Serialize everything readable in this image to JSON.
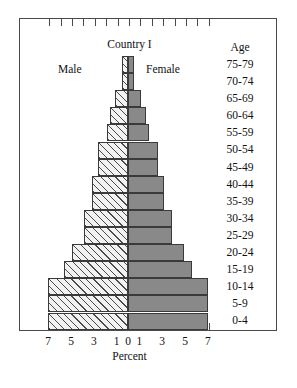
{
  "chart_data": {
    "type": "bar",
    "subtype": "population-pyramid",
    "title": "Country I",
    "xlabel": "Percent",
    "ylabel": "Age",
    "grid": false,
    "legend_position": "in-plot",
    "xlim": [
      -7,
      7
    ],
    "xticks": [
      -7,
      -6,
      -5,
      -4,
      -3,
      -2,
      -1,
      0,
      1,
      2,
      3,
      4,
      5,
      6,
      7
    ],
    "xtick_labels": [
      "7",
      "",
      "5",
      "",
      "3",
      "",
      "1",
      "0",
      "1",
      "",
      "3",
      "",
      "5",
      "",
      "7"
    ],
    "categories": [
      "75-79",
      "70-74",
      "65-69",
      "60-64",
      "55-59",
      "50-54",
      "45-49",
      "40-44",
      "35-39",
      "30-34",
      "25-29",
      "20-24",
      "15-19",
      "10-14",
      "5-9",
      "0-4"
    ],
    "series": [
      {
        "name": "Male",
        "side": "left",
        "fill": "hatched",
        "values": [
          0.5,
          0.5,
          1.1,
          1.6,
          1.8,
          2.6,
          2.6,
          3.2,
          3.2,
          3.9,
          3.9,
          4.9,
          5.6,
          7.0,
          7.0,
          7.0
        ]
      },
      {
        "name": "Female",
        "side": "right",
        "fill": "solid-gray",
        "values": [
          0.5,
          0.5,
          1.1,
          1.6,
          1.8,
          2.6,
          2.6,
          3.2,
          3.2,
          3.9,
          3.9,
          4.9,
          5.6,
          7.0,
          7.0,
          7.0
        ]
      }
    ],
    "annotations": [
      {
        "text": "Male",
        "position": "upper-left-of-axis"
      },
      {
        "text": "Female",
        "position": "upper-right-of-axis"
      }
    ],
    "colors": {
      "male_fill": "#f2f2f2",
      "male_hatch": "#4a4a4a",
      "female_fill": "#898989",
      "outline": "#3a3a3a",
      "frame": "#4a4a4a",
      "text": "#111111"
    }
  },
  "age_heading": "Age"
}
